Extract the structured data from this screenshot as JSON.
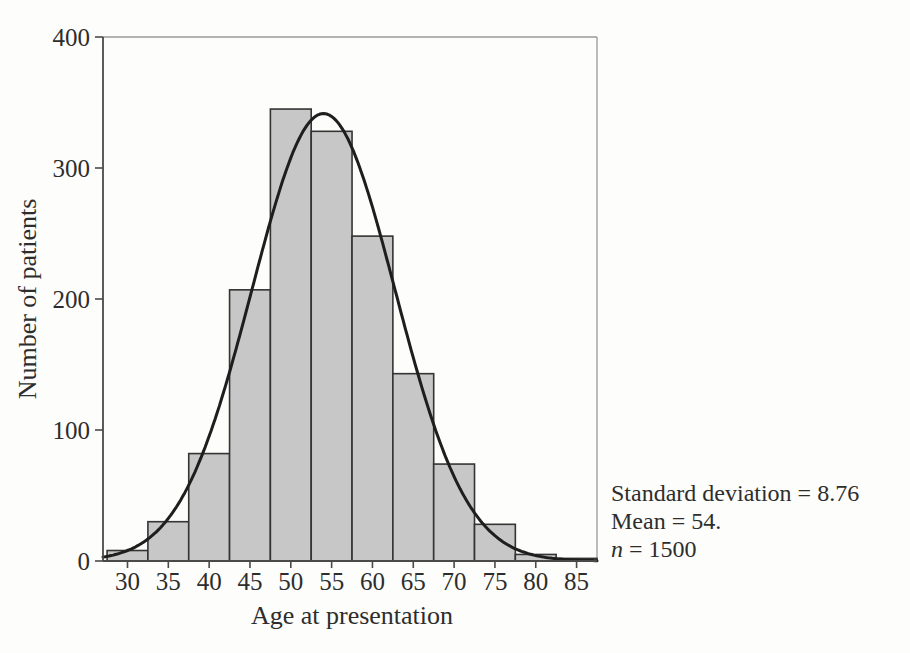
{
  "chart_data": {
    "type": "bar",
    "subtype": "histogram-with-normal-curve",
    "title": "",
    "xlabel": "Age at presentation",
    "ylabel": "Number of patients",
    "categories": [
      30,
      35,
      40,
      45,
      50,
      55,
      60,
      65,
      70,
      75,
      80,
      85
    ],
    "values": [
      8,
      30,
      82,
      207,
      345,
      328,
      248,
      143,
      74,
      28,
      5,
      2
    ],
    "bin_width": 5,
    "xlim": [
      27,
      87.5
    ],
    "ylim": [
      0,
      400
    ],
    "x_ticks": [
      30,
      35,
      40,
      45,
      50,
      55,
      60,
      65,
      70,
      75,
      80,
      85
    ],
    "y_ticks": [
      0,
      100,
      200,
      300,
      400
    ],
    "grid": false,
    "legend_position": "none",
    "overlay_curve": {
      "type": "normal",
      "mean": 54,
      "sd": 8.76,
      "n": 1500
    },
    "annotations": [
      "Standard deviation = 8.76",
      "Mean = 54.",
      "n = 1500"
    ]
  },
  "annotation_block": {
    "line1": "Standard deviation = 8.76",
    "line2": "Mean = 54.",
    "line3_var": "n",
    "line3_rest": " = 1500"
  },
  "colors": {
    "background": "#fdfdfb",
    "bar_fill": "#c7c7c7",
    "bar_stroke": "#343434",
    "curve": "#1e1e1e",
    "axis": "#4a4a4a",
    "frame": "#9a9a9a",
    "text": "#2d2d2d"
  }
}
